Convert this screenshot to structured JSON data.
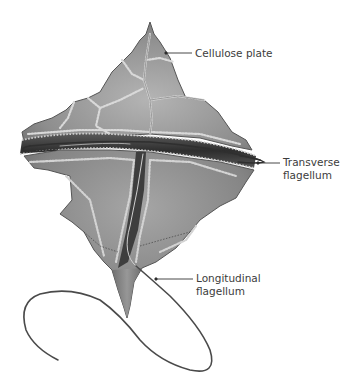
{
  "diagram": {
    "labels": [
      {
        "id": "cellulose-plate",
        "lines": [
          "Cellulose plate"
        ]
      },
      {
        "id": "transverse-flagellum",
        "lines": [
          "Transverse",
          "flagellum"
        ]
      },
      {
        "id": "longitudinal-flagellum",
        "lines": [
          "Longitudinal",
          "flagellum"
        ]
      }
    ]
  },
  "colors": {
    "background": "#ffffff",
    "body_light": "#a9a9a9",
    "body_mid": "#8a8a8a",
    "body_dark": "#4a4a4a",
    "groove": "#3a3a3a",
    "suture": "#d8d8d8",
    "flagellum": "#4a4a4a",
    "leader": "#333333",
    "text": "#3c3c3c"
  }
}
